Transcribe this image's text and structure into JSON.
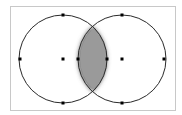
{
  "diagram": {
    "type": "two-circle-intersection",
    "colors": {
      "frame": "#c8c8c8",
      "circle_stroke": "#2a2a2a",
      "lens_fill": "#9a9a9a",
      "lens_halo": "#6e6e6e",
      "point": "#000000",
      "background": "#ffffff"
    },
    "circles": [
      {
        "id": "left",
        "points": [
          "top",
          "left",
          "bottom",
          "center",
          "right-on-axis"
        ]
      },
      {
        "id": "right",
        "points": [
          "top",
          "right",
          "bottom",
          "center",
          "left-on-axis"
        ]
      }
    ],
    "marked_points_count": 10
  }
}
